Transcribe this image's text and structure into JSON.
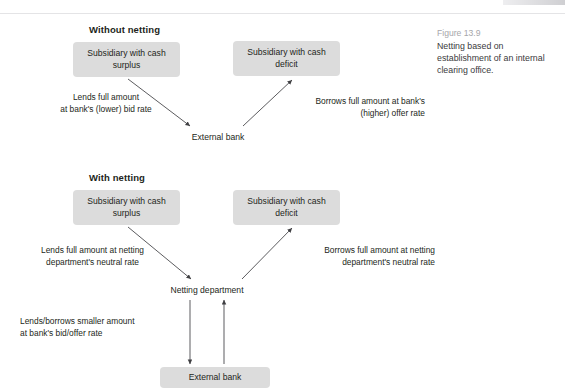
{
  "figure": {
    "number": "Figure 13.9",
    "caption": "Netting based on establishment of an internal clearing office."
  },
  "diagram_top": {
    "title": "Without netting",
    "nodes": {
      "surplus": "Subsidiary with cash surplus",
      "deficit": "Subsidiary with cash deficit",
      "bank": "External bank"
    },
    "labels": {
      "left": "Lends full amount\nat bank's (lower) bid rate",
      "right": "Borrows full amount at bank's\n(higher) offer rate"
    }
  },
  "diagram_bottom": {
    "title": "With netting",
    "nodes": {
      "surplus": "Subsidiary with cash surplus",
      "deficit": "Subsidiary with cash deficit",
      "netting": "Netting department",
      "bank": "External bank"
    },
    "labels": {
      "left": "Lends full amount at netting\ndepartment's neutral rate",
      "right": "Borrows full amount at netting\ndepartment's neutral rate",
      "bottom": "Lends/borrows smaller amount\nat bank's bid/offer rate"
    }
  },
  "style": {
    "box_fill": "#dcdcdc",
    "text_color": "#231f20",
    "caption_gray": "#a6a6aa",
    "arrow_color": "#3f3f42"
  }
}
